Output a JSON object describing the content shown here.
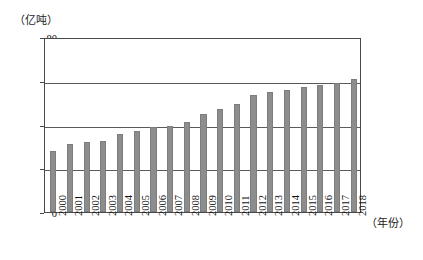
{
  "chart_data": {
    "type": "bar",
    "title": "",
    "subtitle": "",
    "ylabel": "（亿吨）",
    "xlabel": "（年份）",
    "ylim": [
      0,
      80
    ],
    "y_ticks": [
      0,
      20,
      40,
      60,
      80
    ],
    "y_tick_labels": [
      "0",
      "20",
      "40",
      "60",
      "80"
    ],
    "grid": "horizontal",
    "legend": "none",
    "bar_color": "#8d8d8d",
    "axis_color": "#4a4a4a",
    "categories": [
      "2000",
      "2001",
      "2002",
      "2003",
      "2004",
      "2005",
      "2006",
      "2007",
      "2008",
      "2009",
      "2010",
      "2011",
      "2012",
      "2013",
      "2014",
      "2015",
      "2016",
      "2017",
      "2018"
    ],
    "values": [
      28.0,
      31.0,
      32.0,
      32.5,
      35.8,
      37.2,
      39.0,
      39.2,
      41.0,
      45.0,
      47.3,
      49.6,
      53.6,
      55.0,
      56.0,
      57.0,
      58.0,
      59.2,
      61.0
    ]
  }
}
